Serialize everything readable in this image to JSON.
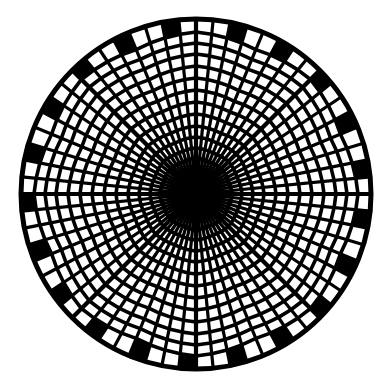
{
  "figure": {
    "canvas": {
      "width": 388,
      "height": 389
    },
    "background_color": "#ffffff",
    "ink_color": "#000000",
    "center": {
      "x": 196,
      "y": 194
    },
    "outer_radius": 175,
    "rim_stroke_width": 5,
    "outer_band_inner_radius": 162,
    "core_radius": 26,
    "spokes": {
      "count": 64,
      "stroke_width": 3.2,
      "inner_radius": 0
    },
    "rings": {
      "radii": [
        36,
        46,
        57,
        68,
        80,
        92,
        104,
        116,
        128,
        140,
        151,
        162
      ],
      "stroke_width": 3.6,
      "sectors": 8,
      "kink": 0.035
    },
    "major_axes": {
      "count": 8,
      "stroke_width": 4.2
    },
    "rim_blocks": {
      "every_nth_cell": 3,
      "offset": 1
    }
  }
}
